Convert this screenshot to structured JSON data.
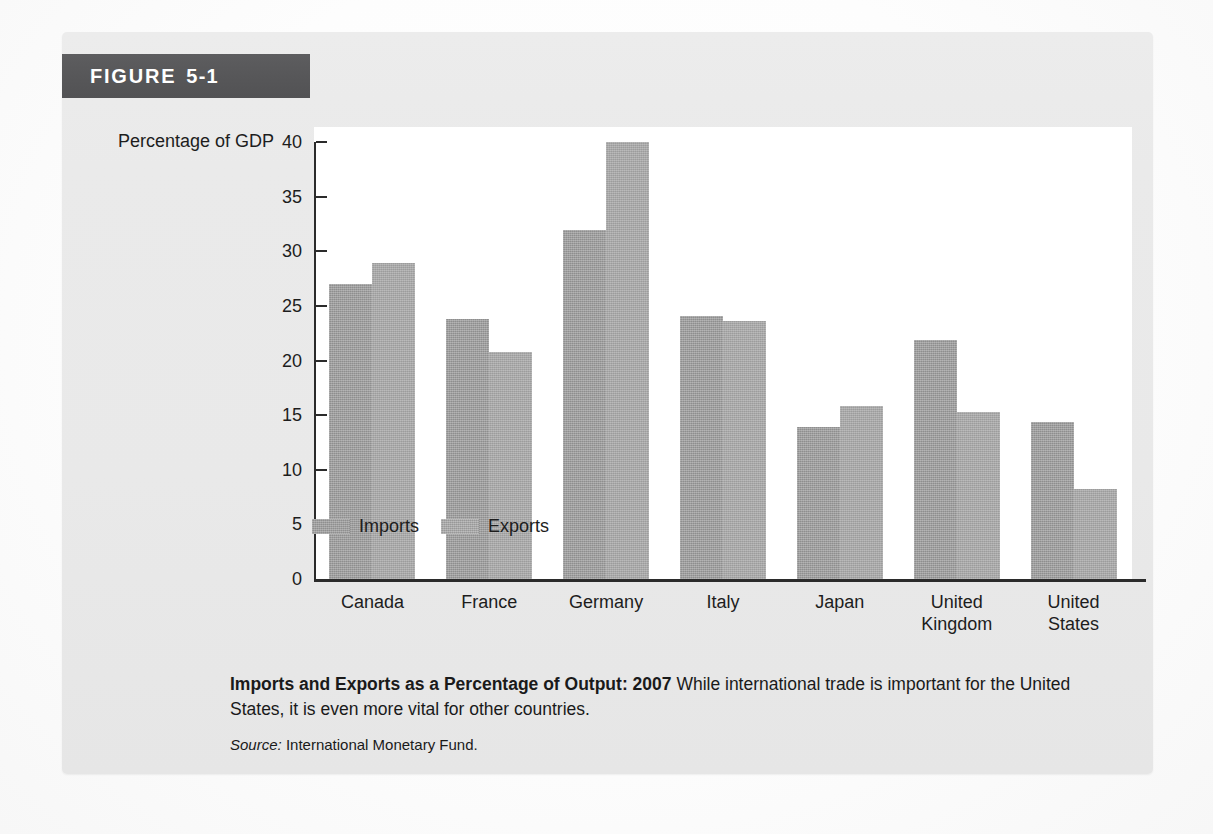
{
  "figure": {
    "banner_word": "FIGURE",
    "banner_number": "5-1"
  },
  "caption": {
    "title": "Imports and Exports as a Percentage of Output: 2007",
    "body": "While international trade is important for the United States, it is even more vital for other countries.",
    "source_label": "Source:",
    "source_text": "International Monetary Fund."
  },
  "legend": {
    "items": [
      {
        "label": "Imports",
        "color": "#9c9c9c"
      },
      {
        "label": "Exports",
        "color": "#a7a7a7"
      }
    ]
  },
  "colors": {
    "banner_background": "#575759",
    "banner_text": "#ffffff",
    "card_background": "#eaeaea",
    "plot_background": "#ffffff",
    "axis": "#2b2b2b",
    "imports_bar": "#9c9c9c",
    "exports_bar": "#a7a7a7"
  },
  "chart_data": {
    "type": "bar",
    "title": "Imports and Exports as a Percentage of Output: 2007",
    "xlabel": "",
    "ylabel": "Percentage of GDP",
    "ylim": [
      0,
      40
    ],
    "yticks": [
      0,
      5,
      10,
      15,
      20,
      25,
      30,
      35,
      40
    ],
    "ytick_labels": [
      "0",
      "5",
      "10",
      "15",
      "20",
      "25",
      "30",
      "35",
      "40"
    ],
    "grid": false,
    "legend_position": "bottom-left",
    "categories": [
      "Canada",
      "France",
      "Germany",
      "Italy",
      "Japan",
      "United Kingdom",
      "United States"
    ],
    "category_lines": [
      [
        "Canada"
      ],
      [
        "France"
      ],
      [
        "Germany"
      ],
      [
        "Italy"
      ],
      [
        "Japan"
      ],
      [
        "United",
        "Kingdom"
      ],
      [
        "United",
        "States"
      ]
    ],
    "series": [
      {
        "name": "Imports",
        "color": "#9c9c9c",
        "values": [
          27.0,
          23.8,
          31.9,
          24.1,
          13.9,
          21.9,
          14.4
        ]
      },
      {
        "name": "Exports",
        "color": "#a7a7a7",
        "values": [
          28.9,
          20.8,
          40.0,
          23.6,
          15.8,
          15.3,
          8.2
        ]
      }
    ]
  }
}
